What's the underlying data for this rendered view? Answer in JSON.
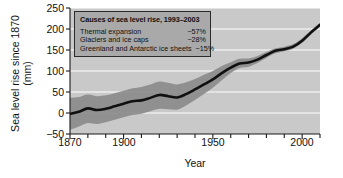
{
  "chart_data": {
    "type": "line",
    "title": "",
    "xlabel": "Year",
    "ylabel_line1": "Sea level rise since 1870",
    "ylabel_line2": "(mm)",
    "xlim": [
      1870,
      2010
    ],
    "ylim": [
      -50,
      250
    ],
    "grid": true,
    "grid_color": "#ffffff",
    "plot_background": "#c9c9c9",
    "line_color": "#101010",
    "band_color": "#8d8d8d",
    "legend_position": "top-left-inside",
    "x_major_ticks": [
      1870,
      1900,
      1950,
      2000
    ],
    "x_major_tick_labels": [
      "1870",
      "1900",
      "1950",
      "2000"
    ],
    "x_minor_tick_step": 10,
    "y_ticks": [
      -50,
      0,
      50,
      100,
      150,
      200,
      250
    ],
    "y_tick_labels": [
      "−50",
      "0",
      "50",
      "100",
      "150",
      "200",
      "250"
    ],
    "x": [
      1870,
      1875,
      1880,
      1885,
      1890,
      1895,
      1900,
      1905,
      1910,
      1915,
      1920,
      1925,
      1930,
      1935,
      1940,
      1945,
      1950,
      1955,
      1960,
      1965,
      1970,
      1975,
      1980,
      1985,
      1990,
      1995,
      2000,
      2005,
      2010
    ],
    "series": [
      {
        "name": "Sea level rise since 1870",
        "values": [
          -2,
          3,
          11,
          7,
          10,
          16,
          22,
          28,
          30,
          36,
          43,
          40,
          37,
          45,
          56,
          68,
          80,
          95,
          108,
          118,
          120,
          127,
          138,
          148,
          152,
          158,
          172,
          192,
          210
        ]
      }
    ],
    "uncertainty_band": {
      "name": "Uncertainty range",
      "lower": [
        -40,
        -32,
        -24,
        -26,
        -22,
        -16,
        -10,
        -5,
        -2,
        4,
        10,
        9,
        8,
        18,
        31,
        45,
        60,
        78,
        95,
        107,
        110,
        119,
        131,
        142,
        147,
        153,
        167,
        187,
        206
      ],
      "upper": [
        36,
        38,
        44,
        40,
        42,
        47,
        53,
        59,
        62,
        68,
        75,
        72,
        68,
        73,
        81,
        91,
        100,
        112,
        121,
        129,
        130,
        136,
        145,
        154,
        158,
        164,
        178,
        197,
        214
      ]
    }
  },
  "legend": {
    "title": "Causes of sea level rise, 1993–2003",
    "rows": [
      {
        "label": "Thermal expansion",
        "value": "~57%"
      },
      {
        "label": "Glaciers and ice caps",
        "value": "~28%"
      },
      {
        "label": "Greenland and Antarctic ice sheets",
        "value": "~15%"
      }
    ]
  }
}
